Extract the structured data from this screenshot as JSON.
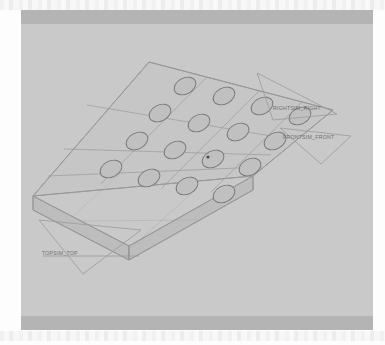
{
  "window": {
    "title": "",
    "background_color": "#fdfdfd"
  },
  "chrome": {
    "top_bar_color": "#b4b4b4",
    "bottom_bar_color": "#b4b4b4"
  },
  "viewport": {
    "name": "cad-3d-viewport",
    "background_color": "#c9c9c9",
    "projection": "isometric",
    "shading": "wireframe-shaded"
  },
  "model": {
    "name": "perforated-plate",
    "description": "Rectangular plate with rectangular pocket cells and a grid of through holes",
    "face_color": "#c3c3c3",
    "edge_color": "#8a8a8a",
    "hole_edge_color": "#777777",
    "hole_grid": {
      "rows": 4,
      "columns": 4,
      "total_holes": 16
    },
    "cell_grid": {
      "rows": 3,
      "columns": 3
    }
  },
  "datum_planes": [
    {
      "id": "right",
      "label": "RIGHTSIM_RIGHT"
    },
    {
      "id": "front",
      "label": "FRONTSIM_FRONT"
    },
    {
      "id": "top",
      "label": "TOPSIM_TOP"
    }
  ]
}
